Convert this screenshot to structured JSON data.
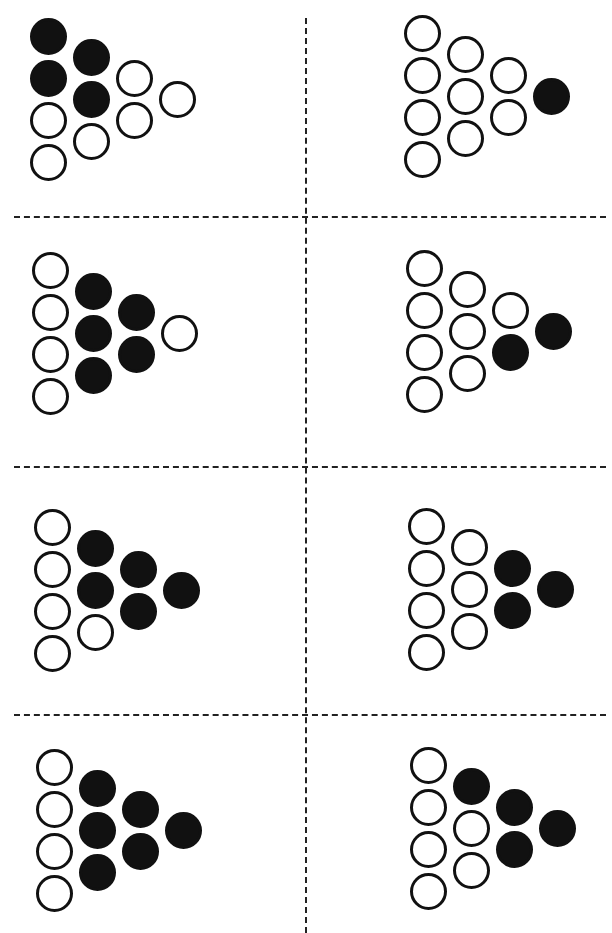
{
  "layout": {
    "columns_per_panel": [
      4,
      3,
      2,
      1
    ],
    "circle_color": "#111111",
    "background": "#ffffff"
  },
  "panels": [
    {
      "id": "r1c1",
      "origin": [
        30,
        18
      ],
      "fills": [
        [
          1,
          1,
          0,
          0
        ],
        [
          1,
          1,
          0
        ],
        [
          0,
          0
        ],
        [
          0
        ]
      ]
    },
    {
      "id": "r1c2",
      "origin": [
        404,
        15
      ],
      "fills": [
        [
          0,
          0,
          0,
          0
        ],
        [
          0,
          0,
          0
        ],
        [
          0,
          0
        ],
        [
          1
        ]
      ]
    },
    {
      "id": "r2c1",
      "origin": [
        32,
        252
      ],
      "fills": [
        [
          0,
          0,
          0,
          0
        ],
        [
          1,
          1,
          1
        ],
        [
          1,
          1
        ],
        [
          0
        ]
      ]
    },
    {
      "id": "r2c2",
      "origin": [
        406,
        250
      ],
      "fills": [
        [
          0,
          0,
          0,
          0
        ],
        [
          0,
          0,
          0
        ],
        [
          0,
          1
        ],
        [
          1
        ]
      ]
    },
    {
      "id": "r3c1",
      "origin": [
        34,
        509
      ],
      "fills": [
        [
          0,
          0,
          0,
          0
        ],
        [
          1,
          1,
          0
        ],
        [
          1,
          1
        ],
        [
          1
        ]
      ]
    },
    {
      "id": "r3c2",
      "origin": [
        408,
        508
      ],
      "fills": [
        [
          0,
          0,
          0,
          0
        ],
        [
          0,
          0,
          0
        ],
        [
          1,
          1
        ],
        [
          1
        ]
      ]
    },
    {
      "id": "r4c1",
      "origin": [
        36,
        749
      ],
      "fills": [
        [
          0,
          0,
          0,
          0
        ],
        [
          1,
          1,
          1
        ],
        [
          1,
          1
        ],
        [
          1
        ]
      ]
    },
    {
      "id": "r4c2",
      "origin": [
        410,
        747
      ],
      "fills": [
        [
          0,
          0,
          0,
          0
        ],
        [
          1,
          0,
          0
        ],
        [
          1,
          1
        ],
        [
          1
        ]
      ]
    }
  ],
  "dividers": {
    "horizontal_y": [
      216,
      476,
      716
    ]
  }
}
